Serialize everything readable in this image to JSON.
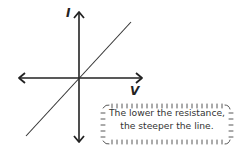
{
  "diagram": {
    "title": "",
    "axes": {
      "y_label": "I",
      "x_label": "V"
    },
    "line": {
      "description": "straight line through origin with positive slope",
      "from": [
        26,
        136
      ],
      "to": [
        131,
        22
      ]
    },
    "note": {
      "line1": "The lower the resistance,",
      "line2": "the steeper the line."
    },
    "colors": {
      "ink": "#222222",
      "text": "#333333",
      "background": "#ffffff"
    }
  }
}
